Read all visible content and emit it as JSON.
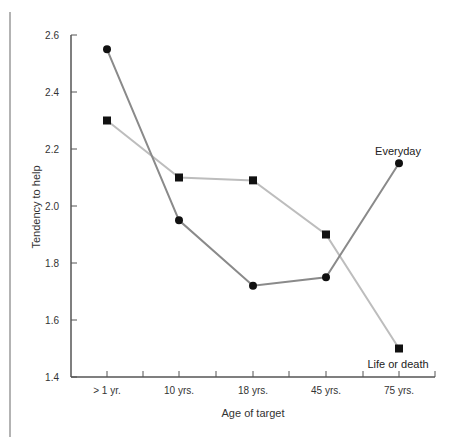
{
  "chart_data": {
    "type": "line",
    "title": "",
    "xlabel": "Age of target",
    "ylabel": "Tendency to help",
    "categories": [
      "> 1 yr.",
      "10 yrs.",
      "18 yrs.",
      "45 yrs.",
      "75 yrs."
    ],
    "ylim": [
      1.4,
      2.6
    ],
    "yticks": [
      "1.4",
      "1.6",
      "1.8",
      "2.0",
      "2.2",
      "2.4",
      "2.6"
    ],
    "grid": false,
    "legend": "inline labels at right end of each series",
    "series": [
      {
        "name": "Everyday",
        "marker": "circle",
        "line_color": "#8a8a8a",
        "values": [
          2.55,
          1.95,
          1.72,
          1.75,
          2.15
        ]
      },
      {
        "name": "Life or death",
        "marker": "square",
        "line_color": "#bdbdbd",
        "values": [
          2.3,
          2.1,
          2.09,
          1.9,
          1.5
        ]
      }
    ]
  },
  "labels": {
    "series_everyday": "Everyday",
    "series_life_or_death": "Life or death",
    "x_axis_title": "Age of target",
    "y_axis_title": "Tendency to help"
  }
}
